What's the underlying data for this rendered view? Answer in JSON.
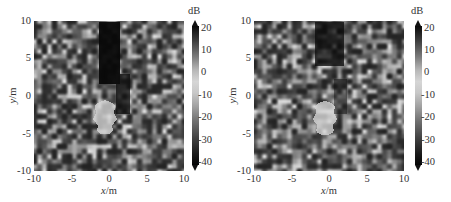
{
  "chart_data": [
    {
      "type": "heatmap",
      "title": "",
      "xlabel": "x/m",
      "ylabel": "y/m",
      "xlim": [
        -10,
        10
      ],
      "ylim": [
        -10,
        10
      ],
      "x_ticks": [
        "-10",
        "-5",
        "0",
        "5",
        "10"
      ],
      "y_ticks": [
        "10",
        "5",
        "0",
        "-5",
        "-10"
      ],
      "colorbar": {
        "label": "dB",
        "range": [
          -40,
          20
        ],
        "ticks": [
          "20",
          "10",
          "0",
          "-10",
          "-20",
          "-30",
          "-40"
        ],
        "colormap": "gray-diverging (black at extremes, light near 0)"
      },
      "features": [
        {
          "name": "dark shadow column",
          "x_range": [
            -1.5,
            1.5
          ],
          "y_range": [
            1,
            10
          ],
          "level_db": -40
        },
        {
          "name": "bright target region",
          "x_range": [
            -1.5,
            1.5
          ],
          "y_range": [
            -3.5,
            1.5
          ],
          "level_db": -5
        }
      ],
      "background": "speckle noise",
      "grid": false
    },
    {
      "type": "heatmap",
      "title": "",
      "xlabel": "x/m",
      "ylabel": "y/m",
      "xlim": [
        -10,
        10
      ],
      "ylim": [
        -10,
        10
      ],
      "x_ticks": [
        "-10",
        "-5",
        "0",
        "5",
        "10"
      ],
      "y_ticks": [
        "10",
        "5",
        "0",
        "-5",
        "-10"
      ],
      "colorbar": {
        "label": "dB",
        "range": [
          -40,
          20
        ],
        "ticks": [
          "20",
          "10",
          "0",
          "-10",
          "-20",
          "-30",
          "-40"
        ],
        "colormap": "gray-diverging (black at extremes, light near 0)"
      },
      "features": [
        {
          "name": "dark shadow column",
          "x_range": [
            -1.5,
            1.5
          ],
          "y_range": [
            4,
            10
          ],
          "level_db": -35
        },
        {
          "name": "bright target region",
          "x_range": [
            -1.5,
            1.5
          ],
          "y_range": [
            -3.5,
            1.5
          ],
          "level_db": -5
        }
      ],
      "background": "speckle noise",
      "grid": false
    }
  ],
  "panels": [
    {
      "ylabel_var": "y",
      "ylabel_unit": "/m",
      "xlabel_var": "x",
      "xlabel_unit": "/m",
      "cbar_unit": "dB",
      "seed": 7,
      "shadow": {
        "x0": 0.43,
        "x1": 0.57,
        "y0": 0.0,
        "y1": 0.42,
        "strength": 0.95
      },
      "shadow_side": {
        "x0": 0.54,
        "x1": 0.64,
        "y0": 0.35,
        "y1": 0.62,
        "strength": 0.8
      },
      "blob": {
        "cx": 0.47,
        "cy": 0.63,
        "rx": 0.07,
        "ry": 0.12
      }
    },
    {
      "ylabel_var": "y",
      "ylabel_unit": "/m",
      "xlabel_var": "x",
      "xlabel_unit": "/m",
      "cbar_unit": "dB",
      "seed": 11,
      "shadow": {
        "x0": 0.4,
        "x1": 0.6,
        "y0": 0.0,
        "y1": 0.3,
        "strength": 0.75
      },
      "shadow_side": {
        "x0": 0.53,
        "x1": 0.62,
        "y0": 0.38,
        "y1": 0.62,
        "strength": 0.5
      },
      "blob": {
        "cx": 0.47,
        "cy": 0.64,
        "rx": 0.07,
        "ry": 0.12
      }
    }
  ],
  "axes": {
    "x_ticks": [
      "-10",
      "-5",
      "0",
      "5",
      "10"
    ],
    "y_ticks": [
      "10",
      "5",
      "0",
      "-5",
      "-10"
    ],
    "cbar_ticks": [
      "20",
      "10",
      "0",
      "-10",
      "-20",
      "-30",
      "-40"
    ]
  }
}
